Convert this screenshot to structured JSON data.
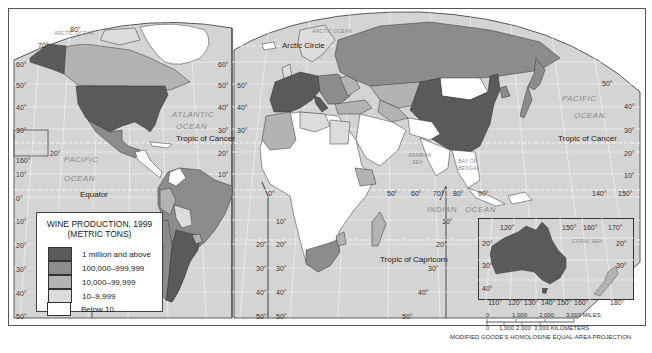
{
  "map": {
    "title": "WINE PRODUCTION, 1999",
    "subtitle": "(METRIC TONS)",
    "projection": "MODIFIED GOODE'S HOMOLOSINE EQUAL-AREA PROJECTION",
    "colors": {
      "ocean": "#d4d4d4",
      "graticule": "#f2f2f2",
      "class1": "#5a5a5a",
      "class2": "#8c8c8c",
      "class3": "#b3b3b3",
      "class4": "#d9d9d9",
      "class5": "#ffffff",
      "border": "#333333"
    }
  },
  "legend": {
    "items": [
      {
        "label": "1 million and above",
        "color": "#5a5a5a"
      },
      {
        "label": "100,000–999,999",
        "color": "#8c8c8c"
      },
      {
        "label": "10,000–99,999",
        "color": "#b3b3b3"
      },
      {
        "label": "10–9,999",
        "color": "#dcdcdc"
      },
      {
        "label": "Below 10",
        "color": "#ffffff"
      }
    ]
  },
  "labels": {
    "oceans": {
      "arctic_west": "ARCTIC OCEAN",
      "arctic_east": "ARCTIC OCEAN",
      "atlantic_1": "ATLANTIC",
      "atlantic_2": "OCEAN",
      "pacific_w1": "PACIFIC",
      "pacific_w2": "OCEAN",
      "pacific_e1": "PACIFIC",
      "pacific_e2": "OCEAN",
      "indian_1": "INDIAN",
      "indian_2": "OCEAN",
      "arabian_1": "ARABIAN",
      "arabian_2": "SEA",
      "bengal_1": "BAY OF",
      "bengal_2": "BENGAL",
      "coral": "CORAL SEA"
    },
    "lines": {
      "arctic_circle": "Arctic Circle",
      "tropic_cancer_w": "Tropic of Cancer",
      "tropic_cancer_e": "Tropic of Cancer",
      "equator": "Equator",
      "tropic_capricorn": "Tropic of Capricorn"
    },
    "lat_left": [
      "70°",
      "80°",
      "60°",
      "50°",
      "40°",
      "30°",
      "20°",
      "160°",
      "10°",
      "0°",
      "10°",
      "20°",
      "30°",
      "40°",
      "50°"
    ],
    "lat_mid_left": [
      "60°",
      "50°",
      "40°",
      "30°",
      "20°",
      "10°"
    ],
    "lat_mid_right": [
      "50°",
      "40°",
      "30°"
    ],
    "sa_lat_left": [
      "20°",
      "30°",
      "40°",
      "50°"
    ],
    "sa_lat_right": [
      "10°",
      "20°",
      "30°",
      "40°",
      "50°"
    ],
    "africa_lat": [
      "10°",
      "20°",
      "30°",
      "40°",
      "50°"
    ],
    "lon_bottom": [
      "0°",
      "50°",
      "60°",
      "70°",
      "80°",
      "90°",
      "140°",
      "150°"
    ],
    "lat_right": [
      "50°",
      "40°",
      "30°",
      "20°",
      "10°"
    ],
    "indian_lat": [
      "10°",
      "20°",
      "30°",
      "40°",
      "50°"
    ]
  },
  "inset": {
    "top_lons": [
      "120°",
      "150°",
      "160°",
      "170°"
    ],
    "bottom_lons": [
      "110°",
      "120°",
      "130°",
      "140°",
      "150°",
      "160°",
      "180°"
    ],
    "left_lats": [
      "20°",
      "30°",
      "40°"
    ],
    "right_lats": [
      "20°",
      "30°"
    ]
  },
  "scale": {
    "miles": [
      "0",
      "1,000",
      "2,000",
      "3,000 MILES"
    ],
    "km": [
      "0",
      "1,000",
      "2,000",
      "3,000 KILOMETERS"
    ]
  }
}
